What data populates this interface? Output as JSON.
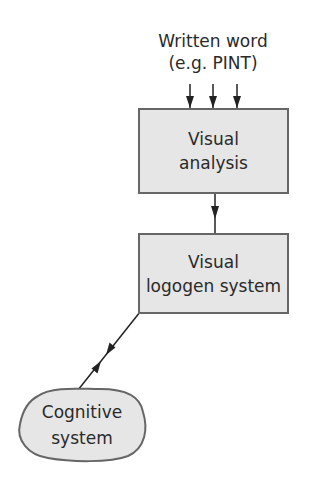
{
  "diagram": {
    "input": {
      "line1": "Written word",
      "line2": "(e.g. PINT)"
    },
    "nodes": [
      {
        "id": "visual-analysis",
        "line1": "Visual",
        "line2": "analysis"
      },
      {
        "id": "visual-logogen-system",
        "line1": "Visual",
        "line2": "logogen system"
      },
      {
        "id": "cognitive-system",
        "line1": "Cognitive",
        "line2": "system"
      }
    ],
    "edges": [
      {
        "from": "written-word",
        "to": "visual-analysis",
        "count": 3,
        "direction": "down"
      },
      {
        "from": "visual-analysis",
        "to": "visual-logogen-system",
        "direction": "down"
      },
      {
        "from": "visual-logogen-system",
        "to": "cognitive-system",
        "direction": "bidirectional"
      }
    ],
    "colors": {
      "box_fill": "#e6e6e6",
      "border": "#666666",
      "text": "#2a2a2a",
      "line": "#222222"
    }
  }
}
